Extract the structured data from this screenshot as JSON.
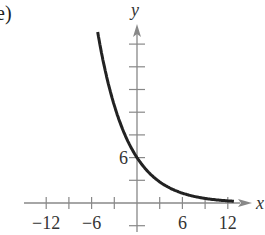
{
  "part_label": "e)",
  "chart_data": {
    "type": "line",
    "title": "",
    "xlabel": "x",
    "ylabel": "y",
    "xlim": [
      -15,
      15
    ],
    "ylim": [
      -3,
      24
    ],
    "x_tick_step": 3,
    "y_tick_step": 3,
    "x_tick_labels": [
      {
        "value": -12,
        "label": "−12"
      },
      {
        "value": -6,
        "label": "−6"
      },
      {
        "value": 6,
        "label": "6"
      },
      {
        "value": 12,
        "label": "12"
      }
    ],
    "y_tick_labels": [
      {
        "value": 6,
        "label": "6"
      }
    ],
    "grid": false,
    "series": [
      {
        "name": "exponential decay",
        "description": "decreasing exponential curve passing through (0, 6), approaching y = 0 as x increases",
        "x": [
          -5,
          -4,
          -3,
          -2,
          -1,
          0,
          2,
          4,
          6,
          8,
          10,
          12
        ],
        "values": [
          21,
          16.5,
          12.7,
          9.9,
          7.7,
          6,
          3.6,
          2.2,
          1.3,
          0.8,
          0.5,
          0.3
        ]
      }
    ],
    "color": "#222222"
  }
}
